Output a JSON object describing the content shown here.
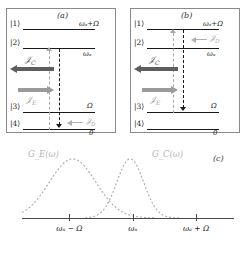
{
  "figure": {
    "panels": [
      {
        "tag": "(a)",
        "levels": [
          {
            "ket": "|1⟩",
            "energy": "ωₐ+Ω"
          },
          {
            "ket": "|2⟩",
            "energy": "ωₐ"
          },
          {
            "ket": "|3⟩",
            "energy": "Ω"
          },
          {
            "ket": "|4⟩",
            "energy": "0"
          }
        ],
        "fluxes": [
          {
            "name": "J_C",
            "label": "𝒥_C",
            "direction": "left",
            "color": "#5e5e5e"
          },
          {
            "name": "J_E",
            "label": "𝒥_E",
            "direction": "right",
            "color": "#9a9a9a"
          },
          {
            "name": "J_D",
            "label": "𝒥_D",
            "direction": "left",
            "color": "#b0b0b0"
          }
        ],
        "transitions": [
          {
            "name": "gray-dashed-up",
            "from": "|4⟩",
            "to": "|2⟩",
            "direction": "up",
            "style": "dashed",
            "color": "#a8a8a8"
          },
          {
            "name": "black-dashdot-down",
            "from": "|2⟩",
            "to": "|4⟩",
            "direction": "down",
            "style": "dash-dot",
            "color": "#1a1a1a"
          }
        ]
      },
      {
        "tag": "(b)",
        "levels": [
          {
            "ket": "|1⟩",
            "energy": "ωₐ+Ω"
          },
          {
            "ket": "|2⟩",
            "energy": "ωₐ"
          },
          {
            "ket": "|3⟩",
            "energy": "Ω"
          },
          {
            "ket": "|4⟩",
            "energy": "0"
          }
        ],
        "fluxes": [
          {
            "name": "J_C",
            "label": "𝒥_C",
            "direction": "left",
            "color": "#5e5e5e"
          },
          {
            "name": "J_E",
            "label": "𝒥_E",
            "direction": "right",
            "color": "#9a9a9a"
          },
          {
            "name": "J_D",
            "label": "𝒥_D",
            "direction": "left",
            "color": "#b0b0b0"
          }
        ],
        "transitions": [
          {
            "name": "gray-dashed-up",
            "from": "|3⟩",
            "to": "|2⟩",
            "direction": "up",
            "style": "dashed",
            "color": "#a8a8a8"
          },
          {
            "name": "black-dashdot-down",
            "from": "|1⟩",
            "to": "|3⟩",
            "direction": "down",
            "style": "dash-dot",
            "color": "#1a1a1a"
          }
        ]
      }
    ],
    "labels": {
      "jc": "𝒥",
      "jc_sub": "C",
      "je_sub": "E",
      "jd_sub": "D",
      "ket1": "|1⟩",
      "ket2": "|2⟩",
      "ket3": "|3⟩",
      "ket4": "|4⟩",
      "e1": "ωₐ+Ω",
      "e2": "ωₐ",
      "e3": "Ω",
      "e4": "0",
      "tag_a": "(a)",
      "tag_b": "(b)",
      "tag_c": "(c)"
    }
  },
  "chart_data": {
    "type": "line",
    "title": "",
    "xlabel": "",
    "ylabel": "",
    "grid": false,
    "legend_position": "inline-above-curves",
    "x_tick_labels": [
      "ωₐ − Ω",
      "ωₐ",
      "ωₐ + Ω"
    ],
    "x_tick_values": [
      -1,
      0,
      1
    ],
    "xlim": [
      -1.75,
      1.6
    ],
    "ylim": [
      0,
      1.05
    ],
    "series": [
      {
        "name": "G_E(ω)",
        "label": "G_E(ω)",
        "style": "dashed",
        "color": "#b0b0b0",
        "peak_x": -0.95,
        "peak_y": 1.0,
        "width": 0.52,
        "x": [
          -1.75,
          -1.6,
          -1.45,
          -1.3,
          -1.15,
          -1.0,
          -0.85,
          -0.7,
          -0.55,
          -0.4,
          -0.25,
          -0.1,
          0.05,
          0.2,
          0.35
        ],
        "y": [
          0.04,
          0.11,
          0.27,
          0.56,
          0.86,
          1.0,
          0.96,
          0.8,
          0.6,
          0.42,
          0.27,
          0.16,
          0.09,
          0.04,
          0.01
        ]
      },
      {
        "name": "G_C(ω)",
        "label": "G_C(ω)",
        "style": "dashed",
        "color": "#b0b0b0",
        "peak_x": -0.04,
        "peak_y": 1.0,
        "width": 0.3,
        "x": [
          -0.75,
          -0.6,
          -0.45,
          -0.3,
          -0.2,
          -0.1,
          -0.04,
          0.05,
          0.15,
          0.3,
          0.45,
          0.6,
          0.75
        ],
        "y": [
          0.02,
          0.07,
          0.22,
          0.6,
          0.85,
          0.98,
          1.0,
          0.9,
          0.7,
          0.4,
          0.18,
          0.06,
          0.02
        ]
      }
    ]
  }
}
